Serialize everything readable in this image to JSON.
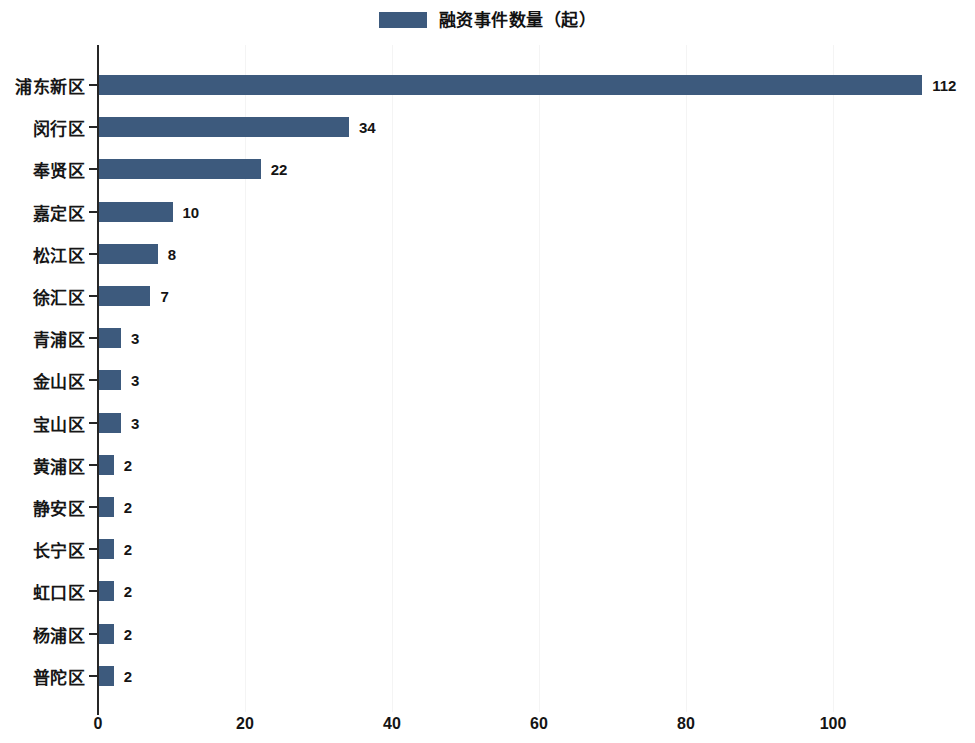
{
  "legend": {
    "label": "融资事件数量（起）",
    "swatch_color": "#3d5a7d",
    "icon": "legend-swatch-icon"
  },
  "axis": {
    "x_ticks": [
      "0",
      "20",
      "40",
      "60",
      "80",
      "100"
    ],
    "x_tick_values": [
      0,
      20,
      40,
      60,
      80,
      100
    ]
  },
  "colors": {
    "bar": "#3d5a7d",
    "axis": "#262626",
    "grid": "#f4f4f4",
    "text": "#141414",
    "background": "#ffffff"
  },
  "chart_data": {
    "type": "bar",
    "orientation": "horizontal",
    "title": "",
    "subtitle": "",
    "xlabel": "",
    "ylabel": "",
    "xlim": [
      0,
      118
    ],
    "grid": true,
    "legend_position": "top-center",
    "series": [
      {
        "name": "融资事件数量（起）",
        "color": "#3d5a7d",
        "values": [
          112,
          34,
          22,
          10,
          8,
          7,
          3,
          3,
          3,
          2,
          2,
          2,
          2,
          2,
          2
        ]
      }
    ],
    "categories": [
      "浦东新区",
      "闵行区",
      "奉贤区",
      "嘉定区",
      "松江区",
      "徐汇区",
      "青浦区",
      "金山区",
      "宝山区",
      "黄浦区",
      "静安区",
      "长宁区",
      "虹口区",
      "杨浦区",
      "普陀区"
    ],
    "data_labels": [
      "112",
      "34",
      "22",
      "10",
      "8",
      "7",
      "3",
      "3",
      "3",
      "2",
      "2",
      "2",
      "2",
      "2",
      "2"
    ],
    "xticks": [
      0,
      20,
      40,
      60,
      80,
      100
    ],
    "xticklabels": [
      "0",
      "20",
      "40",
      "60",
      "80",
      "100"
    ]
  }
}
